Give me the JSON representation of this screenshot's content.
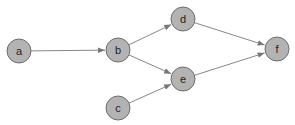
{
  "graph": {
    "type": "directed",
    "nodes": [
      {
        "id": "a",
        "label": "a",
        "x": 19,
        "y": 51
      },
      {
        "id": "b",
        "label": "b",
        "x": 118,
        "y": 50
      },
      {
        "id": "c",
        "label": "c",
        "x": 118,
        "y": 108
      },
      {
        "id": "d",
        "label": "d",
        "x": 183,
        "y": 19
      },
      {
        "id": "e",
        "label": "e",
        "x": 183,
        "y": 79
      },
      {
        "id": "f",
        "label": "f",
        "x": 277,
        "y": 49
      }
    ],
    "edges": [
      {
        "from": "a",
        "to": "b"
      },
      {
        "from": "b",
        "to": "d"
      },
      {
        "from": "b",
        "to": "e"
      },
      {
        "from": "c",
        "to": "e"
      },
      {
        "from": "d",
        "to": "f"
      },
      {
        "from": "e",
        "to": "f"
      }
    ],
    "colors": {
      "node_fill": "#b3b3b3",
      "node_stroke": "#6e6e6e",
      "edge": "#888888"
    }
  }
}
